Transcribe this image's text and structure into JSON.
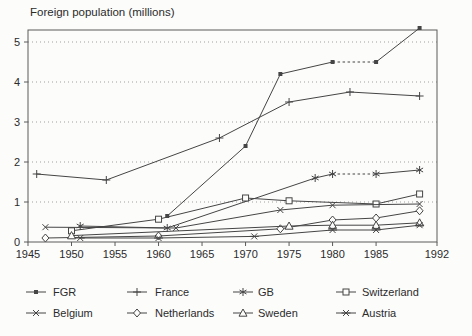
{
  "title": "Foreign population (millions)",
  "colors": {
    "line": "#454545",
    "text": "#2b2b2b",
    "grid": "#a0a0a0",
    "frame": "#5a5a5a",
    "background": "#fcfcfb"
  },
  "chart_data": {
    "type": "line",
    "title": "Foreign population (millions)",
    "xlabel": "",
    "ylabel": "Foreign population (millions)",
    "xlim": [
      1945,
      1992
    ],
    "ylim": [
      0,
      5.3
    ],
    "y_ticks": [
      0,
      1,
      2,
      3,
      4,
      5
    ],
    "x_ticks": [
      1945,
      1950,
      1955,
      1960,
      1965,
      1970,
      1975,
      1980,
      1985,
      1992
    ],
    "x_tick_labels": [
      "1945",
      "1950",
      "1955",
      "1960",
      "1965",
      "1970",
      "1975",
      "1980",
      "1985",
      "1992"
    ],
    "grid": "dotted-horizontal",
    "legend_position": "bottom",
    "series": [
      {
        "name": "FGR",
        "marker": "filled-square",
        "points": [
          [
            1961,
            0.65
          ],
          [
            1970,
            2.4
          ],
          [
            1974,
            4.2
          ],
          [
            1980,
            4.5
          ],
          [
            1985,
            4.5
          ],
          [
            1990,
            5.35
          ]
        ],
        "dashed_segments": [
          3
        ]
      },
      {
        "name": "France",
        "marker": "plus",
        "points": [
          [
            1946,
            1.7
          ],
          [
            1954,
            1.55
          ],
          [
            1967,
            2.6
          ],
          [
            1975,
            3.5
          ],
          [
            1982,
            3.75
          ],
          [
            1990,
            3.65
          ]
        ],
        "dashed_segments": []
      },
      {
        "name": "GB",
        "marker": "asterisk",
        "points": [
          [
            1951,
            0.4
          ],
          [
            1961,
            0.35
          ],
          [
            1978,
            1.6
          ],
          [
            1980,
            1.7
          ],
          [
            1985,
            1.7
          ],
          [
            1990,
            1.8
          ]
        ],
        "dashed_segments": [
          3
        ]
      },
      {
        "name": "Switzerland",
        "marker": "square",
        "points": [
          [
            1950,
            0.28
          ],
          [
            1960,
            0.57
          ],
          [
            1970,
            1.1
          ],
          [
            1975,
            1.03
          ],
          [
            1985,
            0.95
          ],
          [
            1990,
            1.2
          ]
        ],
        "dashed_segments": []
      },
      {
        "name": "Belgium",
        "marker": "x",
        "points": [
          [
            1947,
            0.37
          ],
          [
            1962,
            0.35
          ],
          [
            1974,
            0.8
          ],
          [
            1980,
            0.92
          ],
          [
            1990,
            0.95
          ]
        ],
        "dashed_segments": []
      },
      {
        "name": "Netherlands",
        "marker": "diamond",
        "points": [
          [
            1947,
            0.1
          ],
          [
            1960,
            0.15
          ],
          [
            1974,
            0.33
          ],
          [
            1980,
            0.55
          ],
          [
            1985,
            0.6
          ],
          [
            1990,
            0.78
          ]
        ],
        "dashed_segments": []
      },
      {
        "name": "Sweden",
        "marker": "triangle",
        "points": [
          [
            1950,
            0.16
          ],
          [
            1975,
            0.4
          ],
          [
            1980,
            0.42
          ],
          [
            1985,
            0.42
          ],
          [
            1990,
            0.48
          ]
        ],
        "dashed_segments": []
      },
      {
        "name": "Austria",
        "marker": "x-bar",
        "points": [
          [
            1951,
            0.1
          ],
          [
            1960,
            0.1
          ],
          [
            1971,
            0.14
          ],
          [
            1980,
            0.3
          ],
          [
            1985,
            0.3
          ],
          [
            1990,
            0.42
          ]
        ],
        "dashed_segments": []
      }
    ]
  },
  "legend": {
    "rows": [
      [
        "FGR",
        "France",
        "GB",
        "Switzerland"
      ],
      [
        "Belgium",
        "Netherlands",
        "Sweden",
        "Austria"
      ]
    ]
  }
}
